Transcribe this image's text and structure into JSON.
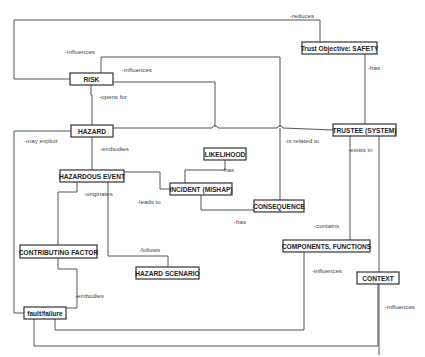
{
  "diagram": {
    "title": "",
    "nodes": [
      {
        "id": "trust_objective",
        "label": "Trust Objective: SAFETY",
        "x": 302,
        "y": 42,
        "w": 75,
        "h": 12
      },
      {
        "id": "risk",
        "label": "RISK",
        "x": 70,
        "y": 73,
        "w": 43,
        "h": 12
      },
      {
        "id": "hazard",
        "label": "HAZARD",
        "x": 71,
        "y": 125,
        "w": 42,
        "h": 12
      },
      {
        "id": "trustee",
        "label": "TRUSTEE (SYSTEM)",
        "x": 333,
        "y": 124,
        "w": 63,
        "h": 12
      },
      {
        "id": "likelihood",
        "label": "LIKELIHOOD",
        "x": 204,
        "y": 148,
        "w": 42,
        "h": 12
      },
      {
        "id": "hazardous_event",
        "label": "HAZARDOUS EVENT",
        "x": 60,
        "y": 170,
        "w": 64,
        "h": 12
      },
      {
        "id": "incident",
        "label": "INCIDENT (MISHAP)",
        "x": 170,
        "y": 183,
        "w": 62,
        "h": 12
      },
      {
        "id": "consequence",
        "label": "CONSEQUENCE",
        "x": 254,
        "y": 200,
        "w": 50,
        "h": 12
      },
      {
        "id": "components",
        "label": "COMPONENTS, FUNCTIONS",
        "x": 283,
        "y": 240,
        "w": 87,
        "h": 12
      },
      {
        "id": "contributing_factor",
        "label": "CONTRIBUTING FACTOR",
        "x": 20,
        "y": 245,
        "w": 77,
        "h": 13
      },
      {
        "id": "hazard_scenario",
        "label": "HAZARD SCENARIO",
        "x": 136,
        "y": 267,
        "w": 63,
        "h": 12
      },
      {
        "id": "context",
        "label": "CONTEXT",
        "x": 357,
        "y": 272,
        "w": 42,
        "h": 12
      },
      {
        "id": "fault_failure",
        "label": "fault/failure",
        "x": 24,
        "y": 307,
        "w": 42,
        "h": 12
      }
    ],
    "edges": [
      {
        "id": "risk_influences_loop",
        "label": "-influences",
        "label_x": 65,
        "label_y": 54,
        "points": "70,79 14,79 14,20 320,20 320,42"
      },
      {
        "id": "reduces",
        "label": "-reduces",
        "label_x": 290,
        "label_y": 18,
        "points": ""
      },
      {
        "id": "risk_influences_likelihood",
        "label": "-influences",
        "label_x": 122,
        "label_y": 72,
        "points": "101,73 101,57 280,57 280,127"
      },
      {
        "id": "risk_to_likelihood",
        "label": "",
        "label_x": 0,
        "label_y": 0,
        "points": "113,82 215,82 215,127"
      },
      {
        "id": "opens_for",
        "label": "-opens for",
        "label_x": 99,
        "label_y": 99,
        "points": "91,85 91,95 92,95 92,125"
      },
      {
        "id": "trust_has",
        "label": "-has",
        "label_x": 368,
        "label_y": 70,
        "points": "365,54 365,124"
      },
      {
        "id": "hazard_trustee",
        "label": "",
        "label_x": 0,
        "label_y": 0,
        "points": "113,128 212,128 M218,128 277,128 M283,128 333,130"
      },
      {
        "id": "may_exploit",
        "label": "-may exploit",
        "label_x": 24,
        "label_y": 143,
        "points": "71,131 14,131 14,313 24,313"
      },
      {
        "id": "embodies_hazard",
        "label": "-embodies",
        "label_x": 100,
        "label_y": 151,
        "points": "92,137 92,170"
      },
      {
        "id": "is_related_to",
        "label": "-is related to",
        "label_x": 285,
        "label_y": 143,
        "points": "280,128 280,200"
      },
      {
        "id": "exists_in",
        "label": "-exists in",
        "label_x": 348,
        "label_y": 152,
        "points": "350,136 350,240"
      },
      {
        "id": "trustee_context",
        "label": "",
        "label_x": 0,
        "label_y": 0,
        "points": "379,136 379,355 M379,355 379,355"
      },
      {
        "id": "likelihood_has",
        "label": "-has",
        "label_x": 222,
        "label_y": 172,
        "points": "225,160 225,170 185,170 185,183"
      },
      {
        "id": "event_incident",
        "label": "",
        "label_x": 0,
        "label_y": 0,
        "points": "124,172 160,172 160,189 170,189"
      },
      {
        "id": "leads_to",
        "label": "-leads to",
        "label_x": 137,
        "label_y": 204,
        "points": ""
      },
      {
        "id": "incident_consequence",
        "label": "",
        "label_x": 0,
        "label_y": 0,
        "points": "201,195 201,210 254,210"
      },
      {
        "id": "consequence_has",
        "label": "-has",
        "label_x": 234,
        "label_y": 224,
        "points": ""
      },
      {
        "id": "contains",
        "label": "-contains",
        "label_x": 314,
        "label_y": 228,
        "points": ""
      },
      {
        "id": "originates",
        "label": "-originates",
        "label_x": 84,
        "label_y": 196,
        "points": "77,182 77,192 58,192 58,245"
      },
      {
        "id": "follows",
        "label": "-follows",
        "label_x": 139,
        "label_y": 252,
        "points": "108,182 108,256 168,256 168,267"
      },
      {
        "id": "embodies_cf",
        "label": "-embodies",
        "label_x": 75,
        "label_y": 298,
        "points": "58,258 58,269 77,269 77,308 66,308"
      },
      {
        "id": "components_influences",
        "label": "-influences",
        "label_x": 312,
        "label_y": 273,
        "points": "304,252 304,330 55,330 55,319"
      },
      {
        "id": "context_influences",
        "label": "-influences",
        "label_x": 385,
        "label_y": 309,
        "points": "378,284 378,346 34,346 34,319"
      }
    ]
  }
}
